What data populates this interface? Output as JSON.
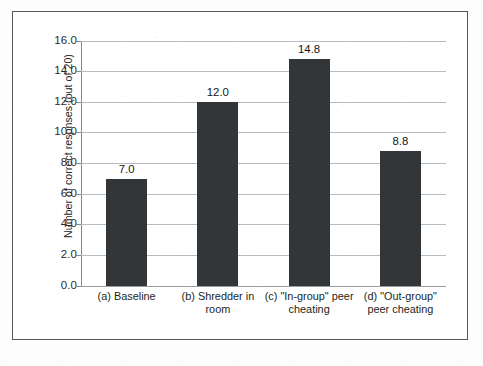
{
  "chart_data": {
    "type": "bar",
    "title": "",
    "subtitle": "",
    "xlabel": "",
    "ylabel": "Number of correct respnses (out of 20)",
    "ylim": [
      0.0,
      16.0
    ],
    "ytick_step": 2.0,
    "ytick_labels": [
      "0.0",
      "2.0",
      "4.0",
      "6.0",
      "8.0",
      "10.0",
      "12.0",
      "14.0",
      "16.0"
    ],
    "ytick_values": [
      0.0,
      2.0,
      4.0,
      6.0,
      8.0,
      10.0,
      12.0,
      14.0,
      16.0
    ],
    "grid": true,
    "grid_axis": "y",
    "legend": false,
    "legend_position": "none",
    "bar_color": "#333638",
    "gridline_color": "#b9bcbe",
    "categories": [
      "(a) Baseline",
      "(b) Shredder in room",
      "(c) \"In-group\" peer cheating",
      "(d) \"Out-group\" peer cheating"
    ],
    "values": [
      7.0,
      12.0,
      14.8,
      8.8
    ],
    "value_labels": [
      "7.0",
      "12.0",
      "14.8",
      "8.8"
    ]
  },
  "figure": {
    "border_color": "#555a5e",
    "background": "#ffffff"
  }
}
